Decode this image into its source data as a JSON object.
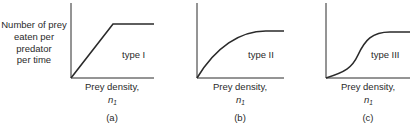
{
  "figure": {
    "ylabel_lines": [
      "Number of prey",
      "eaten per",
      "predator",
      "per time"
    ],
    "xlabel": "Prey density,",
    "xvar": "n",
    "xvar_sub": "1",
    "panels": [
      {
        "id": "a",
        "caption": "(a)",
        "curve_label": "type I"
      },
      {
        "id": "b",
        "caption": "(b)",
        "curve_label": "type II"
      },
      {
        "id": "c",
        "caption": "(c)",
        "curve_label": "type III"
      }
    ]
  },
  "colors": {
    "line": "#2a2a2a",
    "background": "#ffffff"
  }
}
